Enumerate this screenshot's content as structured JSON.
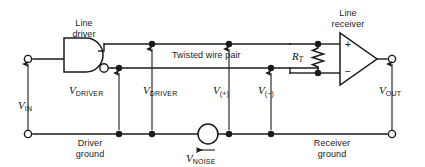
{
  "figure": {
    "name": "twisted-pair-line-driver-receiver-circuit",
    "width": 425,
    "height": 167,
    "background_color": "#ffffff",
    "line_color": "#1b1b1b",
    "text_color": "#111111"
  },
  "labels": {
    "line_driver": "Line\ndriver",
    "line_driver_l1": "Line",
    "line_driver_l2": "driver",
    "line_receiver_l1": "Line",
    "line_receiver_l2": "receiver",
    "twisted_wire_pair": "Twisted wire pair",
    "driver_ground_l1": "Driver",
    "driver_ground_l2": "ground",
    "receiver_ground_l1": "Receiver",
    "receiver_ground_l2": "ground"
  },
  "voltages": [
    {
      "id": "v-in",
      "symbol": "V",
      "subscript": "IN",
      "subscript_style": "upright",
      "arrow": "up",
      "x": 28,
      "label_x": 18,
      "label_y": 101
    },
    {
      "id": "v-driver-1",
      "symbol": "V",
      "subscript": "DRIVER",
      "subscript_style": "upright",
      "arrow": "up",
      "x": 119,
      "label_x": 70,
      "label_y": 84
    },
    {
      "id": "v-driver-2",
      "symbol": "V",
      "subscript": "DRIVER",
      "subscript_style": "upright",
      "arrow": "up",
      "x": 152,
      "label_x": 143,
      "label_y": 84
    },
    {
      "id": "v-plus",
      "symbol": "V",
      "subscript": "(+)",
      "subscript_style": "upright",
      "arrow": "up",
      "x": 229,
      "label_x": 212,
      "label_y": 84
    },
    {
      "id": "v-minus",
      "symbol": "V",
      "subscript": "(−)",
      "subscript_style": "upright",
      "arrow": "up",
      "x": 271,
      "label_x": 262,
      "label_y": 84
    },
    {
      "id": "v-out",
      "symbol": "V",
      "subscript": "OUT",
      "subscript_style": "upright",
      "arrow": "up",
      "x": 392,
      "label_x": 382,
      "label_y": 84
    },
    {
      "id": "v-noise",
      "symbol": "V",
      "subscript": "NOISE",
      "subscript_style": "upright",
      "arrow": "left",
      "x": 208,
      "label_x": 188,
      "label_y": 150
    }
  ],
  "components": {
    "driver_gate": {
      "name": "line-driver-gate",
      "type": "buffer-gate-with-complement-output",
      "has_inverting_bubble": true
    },
    "termination_resistor": {
      "name": "termination-resistor",
      "symbol": "R",
      "subscript": "T",
      "label_x": 293,
      "label_y": 56
    },
    "receiver_opamp": {
      "name": "line-receiver-opamp",
      "plus_sign": "+",
      "minus_sign": "−"
    },
    "noise_source": {
      "name": "noise-voltage-source",
      "type": "circle-source",
      "cx": 208,
      "cy": 134,
      "r": 10
    }
  },
  "terminals": [
    {
      "name": "v-in-top-terminal",
      "cx": 28,
      "cy": 59
    },
    {
      "name": "v-in-bottom-terminal",
      "cx": 28,
      "cy": 134
    },
    {
      "name": "v-out-top-terminal",
      "cx": 392,
      "cy": 59
    },
    {
      "name": "v-out-bottom-terminal",
      "cx": 392,
      "cy": 134
    }
  ],
  "junction_dots": [
    {
      "name": "junction-top-wire-driver",
      "cx": 152,
      "cy": 44
    },
    {
      "name": "junction-top-wire-recv",
      "cx": 229,
      "cy": 44
    },
    {
      "name": "junction-bot-wire-driver",
      "cx": 119,
      "cy": 68
    },
    {
      "name": "junction-bot-wire-recv",
      "cx": 271,
      "cy": 68
    },
    {
      "name": "junction-gnd-driver-1",
      "cx": 119,
      "cy": 134
    },
    {
      "name": "junction-gnd-driver-2",
      "cx": 152,
      "cy": 134
    },
    {
      "name": "junction-gnd-recv-1",
      "cx": 229,
      "cy": 134
    },
    {
      "name": "junction-gnd-recv-2",
      "cx": 271,
      "cy": 134
    },
    {
      "name": "junction-rt-top",
      "cx": 318,
      "cy": 44
    },
    {
      "name": "junction-rt-bottom",
      "cx": 318,
      "cy": 73
    }
  ]
}
